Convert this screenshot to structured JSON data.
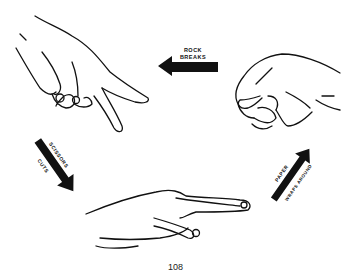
{
  "diagram": {
    "nodes": [
      {
        "id": "scissors",
        "label": "Scissors hand"
      },
      {
        "id": "rock",
        "label": "Rock hand (fist)"
      },
      {
        "id": "paper",
        "label": "Paper hand (flat)"
      }
    ],
    "edges": [
      {
        "from": "rock",
        "to": "scissors",
        "label_line1": "ROCK",
        "label_line2": "BREAKS"
      },
      {
        "from": "scissors",
        "to": "paper",
        "label_line1": "SCISSORS",
        "label_line2": "CUTS"
      },
      {
        "from": "paper",
        "to": "rock",
        "label_line1": "PAPER",
        "label_line2": "WRAPS AROUND"
      }
    ],
    "colors": {
      "ink": "#111111",
      "background": "#ffffff"
    }
  },
  "page_number": "108"
}
